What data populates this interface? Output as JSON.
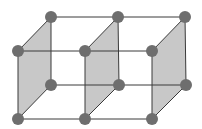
{
  "diagram": {
    "colors": {
      "background": "#ffffff",
      "edge": "#3a3a3a",
      "face_fill": "#c8c8c8",
      "node": "#6e6e6e"
    },
    "node_radius": 6,
    "nodes": [
      {
        "id": "bt0",
        "x": 51,
        "y": 17
      },
      {
        "id": "bt1",
        "x": 118,
        "y": 17
      },
      {
        "id": "bt2",
        "x": 185,
        "y": 17
      },
      {
        "id": "ft0",
        "x": 18,
        "y": 51
      },
      {
        "id": "ft1",
        "x": 85,
        "y": 51
      },
      {
        "id": "ft2",
        "x": 152,
        "y": 51
      },
      {
        "id": "bb0",
        "x": 51,
        "y": 85
      },
      {
        "id": "bb1",
        "x": 119,
        "y": 85
      },
      {
        "id": "bb2",
        "x": 186,
        "y": 85
      },
      {
        "id": "fb0",
        "x": 18,
        "y": 119
      },
      {
        "id": "fb1",
        "x": 85,
        "y": 119
      },
      {
        "id": "fb2",
        "x": 152,
        "y": 119
      }
    ],
    "shaded_faces": [
      [
        "bt0",
        "ft0",
        "fb0",
        "bb0"
      ],
      [
        "bt1",
        "ft1",
        "fb1",
        "bb1"
      ],
      [
        "bt2",
        "ft2",
        "fb2",
        "bb2"
      ]
    ],
    "edges": [
      [
        "bt0",
        "bt1"
      ],
      [
        "bt1",
        "bt2"
      ],
      [
        "ft0",
        "ft1"
      ],
      [
        "ft1",
        "ft2"
      ],
      [
        "bb0",
        "bb1"
      ],
      [
        "bb1",
        "bb2"
      ],
      [
        "fb0",
        "fb1"
      ],
      [
        "fb1",
        "fb2"
      ],
      [
        "bt0",
        "ft0"
      ],
      [
        "bt1",
        "ft1"
      ],
      [
        "bt2",
        "ft2"
      ],
      [
        "bb0",
        "fb0"
      ],
      [
        "bb1",
        "fb1"
      ],
      [
        "bb2",
        "fb2"
      ],
      [
        "bt0",
        "bb0"
      ],
      [
        "bt1",
        "bb1"
      ],
      [
        "bt2",
        "bb2"
      ],
      [
        "ft0",
        "fb0"
      ],
      [
        "ft1",
        "fb1"
      ],
      [
        "ft2",
        "fb2"
      ]
    ]
  }
}
